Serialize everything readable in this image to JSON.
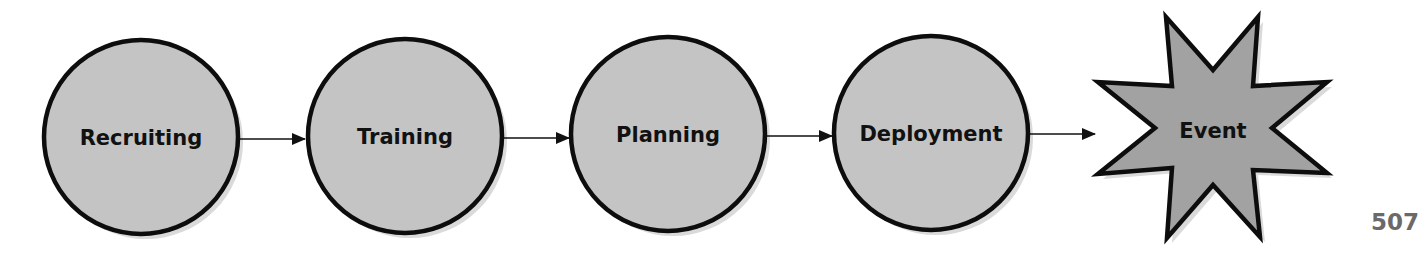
{
  "diagram": {
    "type": "process-flow",
    "direction": "left-to-right",
    "nodes": [
      {
        "id": "recruiting",
        "label": "Recruiting",
        "shape": "circle",
        "cx": 141,
        "cy": 137,
        "r": 97
      },
      {
        "id": "training",
        "label": "Training",
        "shape": "circle",
        "cx": 405,
        "cy": 136,
        "r": 97
      },
      {
        "id": "planning",
        "label": "Planning",
        "shape": "circle",
        "cx": 668,
        "cy": 134,
        "r": 97
      },
      {
        "id": "deployment",
        "label": "Deployment",
        "shape": "circle",
        "cx": 931,
        "cy": 133,
        "r": 97
      },
      {
        "id": "event",
        "label": "Event",
        "shape": "8-point-star",
        "cx": 1213,
        "cy": 128
      }
    ],
    "edges": [
      {
        "from": "recruiting",
        "to": "training"
      },
      {
        "from": "training",
        "to": "planning"
      },
      {
        "from": "planning",
        "to": "deployment"
      },
      {
        "from": "deployment",
        "to": "event"
      }
    ],
    "colors": {
      "circle_fill": "#c4c4c4",
      "star_fill": "#a2a2a2",
      "stroke": "#0d0d0d",
      "shadow": "#d8d8d8",
      "arrow": "#111111"
    }
  },
  "page_number": "507"
}
